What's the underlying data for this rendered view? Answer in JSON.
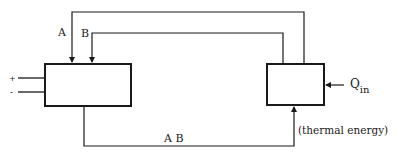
{
  "diagram": {
    "labels": {
      "line_a": "A",
      "line_b": "B",
      "line_ab": "A B",
      "plus": "+",
      "minus": "-",
      "q_main": "Q",
      "q_sub": "in",
      "thermal": "(thermal energy)"
    },
    "colors": {
      "stroke": "#1a1a1a",
      "background": "#ffffff"
    },
    "nodes": [
      {
        "id": "left-block",
        "x": 45,
        "y": 64,
        "w": 86,
        "h": 42
      },
      {
        "id": "right-block",
        "x": 267,
        "y": 64,
        "w": 57,
        "h": 41
      }
    ]
  }
}
